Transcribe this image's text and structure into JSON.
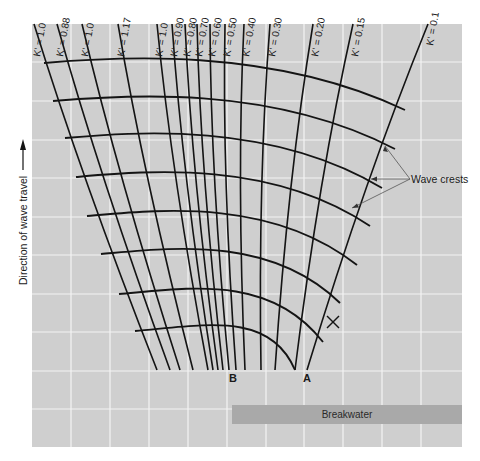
{
  "figure": {
    "type": "wave diffraction diagram",
    "axis_label": "Direction of wave travel",
    "axis_arrow": "arrow-up",
    "colors": {
      "background": "#cfcfcf",
      "grid": "#f4f4f4",
      "lines": "#141414",
      "breakwater": "#a9a9a9"
    },
    "rays": [
      {
        "label": "K' = 1.0"
      },
      {
        "label": "K' = 0.88"
      },
      {
        "label": "K' = 1.0"
      },
      {
        "label": "K' = 1.17"
      },
      {
        "label": "K' = 1.0"
      },
      {
        "label": "K' = 0.90"
      },
      {
        "label": "K' = 0.80"
      },
      {
        "label": "K' = 0.70"
      },
      {
        "label": "K' = 0.60"
      },
      {
        "label": "K' = 0.50"
      },
      {
        "label": "K' = 0.40"
      },
      {
        "label": "K' = 0.30"
      },
      {
        "label": "K' = 0.20"
      },
      {
        "label": "K' = 0.15"
      },
      {
        "label": "K' = 0.1"
      }
    ],
    "crest_count": 8,
    "points": {
      "a": "A",
      "b": "B"
    },
    "annotation": "Wave crests",
    "breakwater_label": "Breakwater",
    "marker": "x-mark"
  }
}
